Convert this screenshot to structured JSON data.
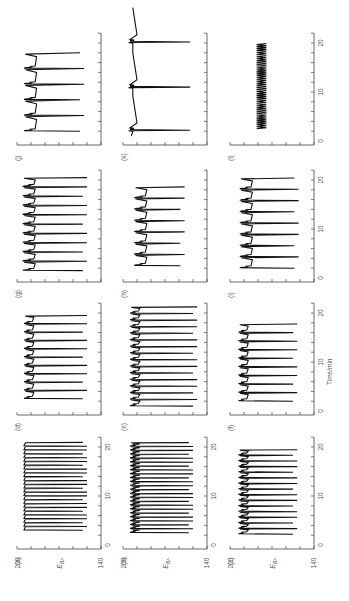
{
  "figure": {
    "orientation": "rotated-90-ccw",
    "trace_color": "#111111",
    "axis_color": "#444444",
    "text_color": "#555555"
  },
  "chart_data": {
    "type": "line",
    "title": "",
    "xlabel": "Time/min",
    "ylabel": "E_Br-",
    "ylabel_main": "E",
    "ylabel_sub": "Br-",
    "xlim": [
      0,
      22
    ],
    "ylim": [
      140,
      200
    ],
    "x_ticks": [
      0,
      10,
      20
    ],
    "x_minor_step": 2,
    "y_ticks": [
      200,
      140
    ],
    "y_minor_step": 10,
    "grid": false,
    "legend": null,
    "panels": [
      {
        "label": "(a)",
        "col": 0,
        "row": 3,
        "show_ylabels": true,
        "show_xlabels": true,
        "pattern": "simple",
        "t_start": 3.0,
        "t_end": 21.0,
        "period": 0.78,
        "e_high": 195,
        "e_low": 150,
        "bumps": false
      },
      {
        "label": "(b)",
        "col": 1,
        "row": 3,
        "show_ylabels": true,
        "show_xlabels": true,
        "pattern": "mixed",
        "t_start": 2.5,
        "t_end": 21.5,
        "period": 0.8,
        "e_high": 195,
        "e_low": 150,
        "bumps": true
      },
      {
        "label": "(c)",
        "col": 2,
        "row": 3,
        "show_ylabels": true,
        "show_xlabels": true,
        "pattern": "bump",
        "t_start": 2.2,
        "t_end": 19.5,
        "period": 1.15,
        "e_high": 194,
        "e_low": 152,
        "bumps": true
      },
      {
        "label": "(d)",
        "col": 0,
        "row": 2,
        "show_ylabels": false,
        "show_xlabels": false,
        "pattern": "bump",
        "t_start": 2.5,
        "t_end": 20.5,
        "period": 1.7,
        "e_high": 195,
        "e_low": 150,
        "bumps": true
      },
      {
        "label": "(e)",
        "col": 1,
        "row": 2,
        "show_ylabels": false,
        "show_xlabels": false,
        "pattern": "bump",
        "t_start": 1.0,
        "t_end": 21.5,
        "period": 1.35,
        "e_high": 195,
        "e_low": 147,
        "bumps": true
      },
      {
        "label": "(f)",
        "col": 2,
        "row": 2,
        "show_ylabels": false,
        "show_xlabels": true,
        "pattern": "bump",
        "t_start": 2.0,
        "t_end": 18.5,
        "period": 1.75,
        "e_high": 194,
        "e_low": 152,
        "bumps": true
      },
      {
        "label": "(g)",
        "col": 0,
        "row": 1,
        "show_ylabels": false,
        "show_xlabels": false,
        "pattern": "step",
        "t_start": 1.5,
        "t_end": 22.0,
        "period": 1.9,
        "e_high": 196,
        "e_low": 150,
        "bumps": true
      },
      {
        "label": "(h)",
        "col": 1,
        "row": 1,
        "show_ylabels": false,
        "show_xlabels": false,
        "pattern": "step",
        "t_start": 2.5,
        "t_end": 19.0,
        "period": 2.3,
        "e_high": 192,
        "e_low": 156,
        "bumps": true
      },
      {
        "label": "(i)",
        "col": 2,
        "row": 1,
        "show_ylabels": false,
        "show_xlabels": true,
        "pattern": "step",
        "t_start": 2.0,
        "t_end": 21.5,
        "period": 2.3,
        "e_high": 193,
        "e_low": 151,
        "bumps": true
      },
      {
        "label": "(j)",
        "col": 0,
        "row": 0,
        "show_ylabels": false,
        "show_xlabels": false,
        "pattern": "step",
        "t_start": 2.0,
        "t_end": 18.0,
        "period": 3.2,
        "e_high": 195,
        "e_low": 152,
        "bumps": true
      },
      {
        "label": "(k)",
        "col": 1,
        "row": 0,
        "show_ylabels": false,
        "show_xlabels": false,
        "pattern": "spike",
        "t_start": 1.0,
        "t_end": 21.0,
        "spikes": [
          2.2,
          11.0,
          20.2
        ],
        "e_high": 194,
        "e_low": 152,
        "bumps": false
      },
      {
        "label": "(l)",
        "col": 2,
        "row": 0,
        "show_ylabels": false,
        "show_xlabels": true,
        "pattern": "small",
        "t_start": 2.5,
        "t_end": 20.0,
        "period": 0.4,
        "e_high": 181,
        "e_low": 174,
        "bumps": false
      }
    ]
  },
  "layout": {
    "col_axis_x": [
      101,
      207,
      314
    ],
    "row_base_y": [
      145,
      282,
      415,
      549
    ],
    "e_axis_len": 84,
    "px_per_min": 4.9,
    "t0_offset": 4
  }
}
